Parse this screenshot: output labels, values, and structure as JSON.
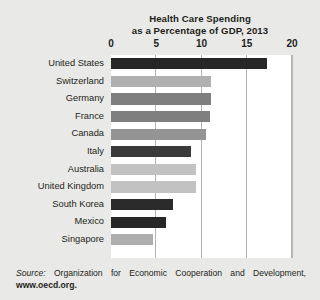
{
  "chart_data": {
    "type": "bar",
    "orientation": "horizontal",
    "title": "Health Care Spending as a Percentage of GDP, 2013",
    "title_line1": "Health Care Spending",
    "title_line2": "as a Percentage of GDP, 2013",
    "xlabel": "",
    "ylabel": "",
    "xlim": [
      0,
      20
    ],
    "xticks": [
      0,
      5,
      10,
      15,
      20
    ],
    "xtick_labels": [
      "0",
      "5",
      "10",
      "15",
      "20"
    ],
    "grid": "vertical",
    "legend": "none",
    "categories": [
      "United States",
      "Switzerland",
      "Germany",
      "France",
      "Canada",
      "Italy",
      "Australia",
      "United Kingdom",
      "South Korea",
      "Mexico",
      "Singapore"
    ],
    "values": [
      17.2,
      11.1,
      11.0,
      10.9,
      10.5,
      8.8,
      9.4,
      9.4,
      6.9,
      6.1,
      4.6
    ],
    "bar_colors": [
      "#262626",
      "#b0b0b0",
      "#7f7f7f",
      "#7f7f7f",
      "#949494",
      "#3a3a3a",
      "#c2c2c2",
      "#c2c2c2",
      "#2b2b2b",
      "#272727",
      "#aeaeae"
    ]
  },
  "source": {
    "label": "Source:",
    "text": "Organization for Economic Cooperation and Development,",
    "url": "www.oecd.org."
  },
  "colors": {
    "page_background": "#e9e9e7",
    "plot_background": "#ffffff",
    "gridline": "#b3b3b3",
    "text": "#231f20"
  }
}
